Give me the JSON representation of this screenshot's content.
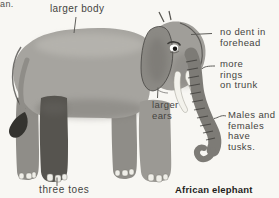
{
  "caption": "African elephant",
  "page_fragment": "an.",
  "labels": {
    "larger_body": "larger body",
    "no_dent_forehead": "no dent in\nforehead",
    "more_rings_on_trunk": "more\nrings\non trunk",
    "larger_ears": "larger\nears",
    "males_females_tusks": "Males and\nfemales\nhave tusks.",
    "three_toes": "three toes"
  },
  "colors": {
    "background": "#f8f7f3",
    "label-text": "#454441",
    "caption-text": "#1f1e1c",
    "fragment-text": "#525150",
    "leader-line": "#5e5d59",
    "elephant-body": "#a6a49f",
    "elephant-head": "#a09e99",
    "elephant-ear": "#8b8984",
    "elephant-trunk": "#7d7b76",
    "elephant-dark-leg": "#56544f",
    "elephant-far-leg": "#8f8d88",
    "elephant-near-front-leg": "#9b9994",
    "elephant-outline": "#3a3936",
    "tusk-white": "#f3f2ec",
    "tail-tuft": "#34332f",
    "toenail": "#efeee8",
    "shadow": "#6e6c67",
    "highlight": "#c6c4be"
  }
}
